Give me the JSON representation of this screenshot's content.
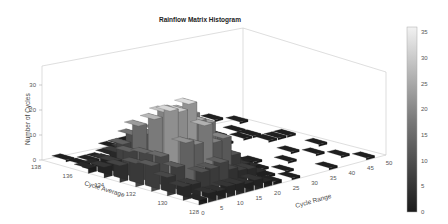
{
  "chart_data": {
    "type": "bar3d",
    "title": "Rainflow Matrix Histogram",
    "xlabel": "Cycle Range",
    "ylabel": "Cycle Average",
    "zlabel": "Number of Cycles",
    "x_ticks": [
      0,
      5,
      10,
      15,
      20,
      25,
      30,
      35,
      40,
      45,
      50
    ],
    "y_ticks": [
      128,
      130,
      132,
      134,
      136,
      138
    ],
    "z_ticks": [
      0,
      10,
      20,
      30
    ],
    "xlim": [
      0,
      50
    ],
    "ylim": [
      128,
      138
    ],
    "zlim": [
      0,
      37
    ],
    "colorbar": {
      "ticks": [
        0,
        5,
        10,
        15,
        20,
        25,
        30,
        35
      ],
      "range": [
        0,
        36
      ],
      "colormap": "gray"
    },
    "peak": {
      "cycle_range": 10,
      "cycle_average": 132,
      "count": 35
    },
    "grid": false,
    "legend": "none"
  }
}
